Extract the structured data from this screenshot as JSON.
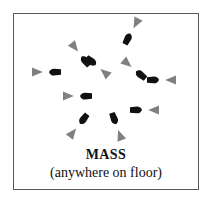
{
  "figure": {
    "title": "MASS",
    "subtitle": "(anywhere on floor)",
    "border_color": "#5a5a5a",
    "background_color": "#ffffff"
  },
  "legend_colors": {
    "body_marker": "#111111",
    "facing_arrow": "#808080"
  },
  "dancers": [
    {
      "id": "dancer-1",
      "x": 118,
      "y": 17,
      "angle": -62,
      "body_color": "#111111",
      "arrow_color": "#808080"
    },
    {
      "id": "dancer-2",
      "x": 66,
      "y": 40,
      "angle": -128,
      "body_color": "#111111",
      "arrow_color": "#808080"
    },
    {
      "id": "dancer-3",
      "x": 32,
      "y": 58,
      "angle": 180,
      "body_color": "#111111",
      "arrow_color": "#808080"
    },
    {
      "id": "dancer-4",
      "x": 63,
      "y": 82,
      "angle": 180,
      "body_color": "#111111",
      "arrow_color": "#808080"
    },
    {
      "id": "dancer-5",
      "x": 64,
      "y": 112,
      "angle": 128,
      "body_color": "#111111",
      "arrow_color": "#808080"
    },
    {
      "id": "dancer-6",
      "x": 103,
      "y": 113,
      "angle": 70,
      "body_color": "#111111",
      "arrow_color": "#808080"
    },
    {
      "id": "dancer-7",
      "x": 131,
      "y": 96,
      "angle": 0,
      "body_color": "#111111",
      "arrow_color": "#808080"
    },
    {
      "id": "dancer-8",
      "x": 148,
      "y": 66,
      "angle": 0,
      "body_color": "#111111",
      "arrow_color": "#808080"
    },
    {
      "id": "dancer-9",
      "x": 120,
      "y": 55,
      "angle": -140,
      "body_color": "#111111",
      "arrow_color": "#808080"
    },
    {
      "id": "dancer-10",
      "x": 84,
      "y": 53,
      "angle": 40,
      "body_color": "#111111",
      "arrow_color": "#808080"
    }
  ]
}
